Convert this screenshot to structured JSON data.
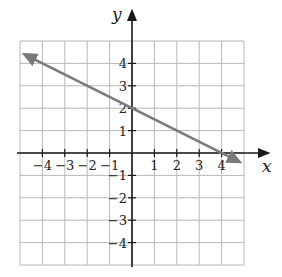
{
  "chart_data": {
    "type": "line",
    "title": "",
    "xlabel": "x",
    "ylabel": "y",
    "xlim": [
      -5,
      5
    ],
    "ylim": [
      -5,
      5
    ],
    "grid": true,
    "x_ticks": [
      -4,
      -3,
      -2,
      -1,
      1,
      2,
      3,
      4
    ],
    "y_ticks": [
      4,
      3,
      2,
      1,
      -1,
      -2,
      -3,
      -4
    ],
    "x_tick_labels": [
      "−4",
      "−3",
      "−2",
      "−1",
      "1",
      "2",
      "3",
      "4"
    ],
    "y_tick_labels": [
      "4",
      "3",
      "2",
      "1",
      "−1",
      "−2",
      "−3",
      "−4"
    ],
    "series": [
      {
        "name": "line",
        "equation": "y = -0.5x + 2",
        "slope": -0.5,
        "intercept": 2,
        "x": [
          -4.8,
          0,
          4,
          4.8
        ],
        "y": [
          4.4,
          2,
          0,
          -0.4
        ],
        "arrows": "both",
        "color": "#7a7a7a"
      }
    ],
    "key_points": [
      {
        "label": "y-intercept",
        "x": 0,
        "y": 2
      },
      {
        "label": "x-intercept",
        "x": 4,
        "y": 0
      }
    ]
  }
}
